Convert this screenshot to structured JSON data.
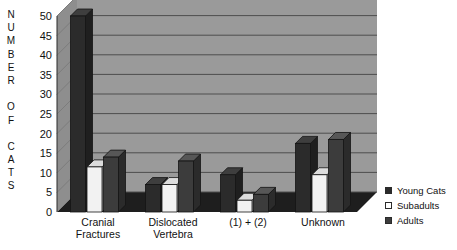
{
  "chart_data": {
    "type": "bar",
    "title": "",
    "subtitle": "",
    "xlabel": "",
    "ylabel": "NUMBER OF CATS",
    "categories": [
      "Cranial Fractures",
      "Dislocated Vertebra",
      "(1) + (2)",
      "Unknown"
    ],
    "category_lines": [
      [
        "Cranial",
        "Fractures"
      ],
      [
        "Dislocated",
        "Vertebra"
      ],
      [
        "(1) + (2)",
        ""
      ],
      [
        "Unknown",
        ""
      ]
    ],
    "series": [
      {
        "name": "Young Cats",
        "color": "#2b2b2b",
        "values": [
          50,
          7,
          9.5,
          17.5
        ]
      },
      {
        "name": "Subadults",
        "color": "#f2f2f2",
        "values": [
          11.5,
          7,
          3,
          9.5
        ]
      },
      {
        "name": "Adults",
        "color": "#3c3c3c",
        "values": [
          14,
          13,
          4.5,
          18.5
        ]
      }
    ],
    "ylim": [
      0,
      50
    ],
    "ytick_values": [
      0,
      5,
      10,
      15,
      20,
      25,
      30,
      35,
      40,
      45,
      50
    ],
    "ytick_labels": [
      "0",
      "5",
      "10",
      "15",
      "20",
      "25",
      "30",
      "35",
      "40",
      "45",
      "50"
    ],
    "grid": true,
    "grid_axis": "y",
    "legend_position": "right",
    "style": "3d-column",
    "plot_background": "#9a9a9a",
    "floor_color": "#1e1e1e",
    "grid_color": "#4e4e4e"
  },
  "ylabel_letters": [
    "N",
    "U",
    "M",
    "B",
    "E",
    "R",
    "",
    "O",
    "F",
    "",
    "C",
    "A",
    "T",
    "S"
  ],
  "legend": {
    "title": "",
    "items": [
      {
        "label": "Young Cats",
        "swatch": "#2b2b2b",
        "marker": "filled-square-swatch"
      },
      {
        "label": "Subadults",
        "swatch": "#ffffff",
        "marker": "hollow-square-swatch"
      },
      {
        "label": "Adults",
        "swatch": "#3c3c3c",
        "marker": "filled-square-swatch"
      }
    ]
  }
}
